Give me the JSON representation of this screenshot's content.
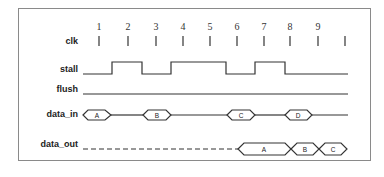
{
  "diagram": {
    "type": "timing",
    "signals": [
      {
        "name": "clk",
        "label": "clk"
      },
      {
        "name": "stall",
        "label": "stall"
      },
      {
        "name": "flush",
        "label": "flush"
      },
      {
        "name": "data_in",
        "label": "data_in"
      },
      {
        "name": "data_out",
        "label": "data_out"
      }
    ],
    "clock_cycles": [
      "1",
      "2",
      "3",
      "4",
      "5",
      "6",
      "7",
      "8",
      "9"
    ],
    "stall_waveform": "low cyc1-1.5, high 1.5-2.5, low 2.5-3.5, high 3.5-5.5, low 5.5-6.5, high 6.5-7.5, low 7.5-end",
    "flush_waveform": "low throughout",
    "data_in_values": [
      "A",
      "B",
      "C",
      "D"
    ],
    "data_out_values": [
      "A",
      "B",
      "C"
    ],
    "colors": {
      "line": "#333333",
      "frame": "#8a8a8a",
      "text": "#222222"
    }
  }
}
